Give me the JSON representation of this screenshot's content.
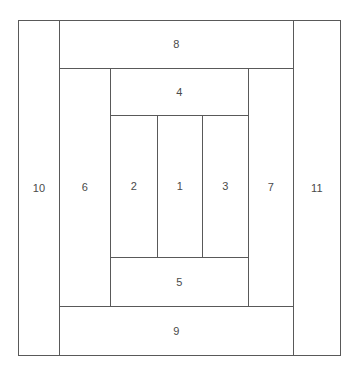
{
  "diagram": {
    "type": "nested-rectangles-layout",
    "canvas": {
      "width": 357,
      "height": 371,
      "background": "#ffffff"
    },
    "stroke_color": "#595959",
    "label_color": "#4a4a4a",
    "regions": [
      {
        "id": "region-1",
        "label": "1",
        "role": "center-cell"
      },
      {
        "id": "region-2",
        "label": "2",
        "role": "left-inner-cell"
      },
      {
        "id": "region-3",
        "label": "3",
        "role": "right-inner-cell"
      },
      {
        "id": "region-4",
        "label": "4",
        "role": "top-inner-band"
      },
      {
        "id": "region-5",
        "label": "5",
        "role": "bottom-inner-band"
      },
      {
        "id": "region-6",
        "label": "6",
        "role": "left-middle-column"
      },
      {
        "id": "region-7",
        "label": "7",
        "role": "right-middle-column"
      },
      {
        "id": "region-8",
        "label": "8",
        "role": "top-middle-band"
      },
      {
        "id": "region-9",
        "label": "9",
        "role": "bottom-middle-band"
      },
      {
        "id": "region-10",
        "label": "10",
        "role": "left-outer-column"
      },
      {
        "id": "region-11",
        "label": "11",
        "role": "right-outer-column"
      }
    ]
  }
}
